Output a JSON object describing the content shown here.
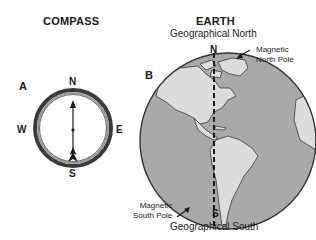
{
  "compass": {
    "title": "COMPASS",
    "panel_label": "A",
    "directions": {
      "north": "N",
      "south": "S",
      "east": "E",
      "west": "W"
    }
  },
  "earth": {
    "title": "EARTH",
    "panel_label": "B",
    "geographical_north": "Geographical North",
    "geographical_south": "Geographical South",
    "north_marker": "N",
    "south_marker": "S",
    "magnetic_north_line1": "Magnetic",
    "magnetic_north_line2": "North Pole",
    "magnetic_south_line1": "Magnetic",
    "magnetic_south_line2": "South Pole"
  },
  "colors": {
    "ocean": "#a9a9a9",
    "land": "#dcdcdc",
    "outline": "#333333",
    "ring_outer": "#3a3a3a",
    "ring_inner": "#9a9a9a"
  }
}
